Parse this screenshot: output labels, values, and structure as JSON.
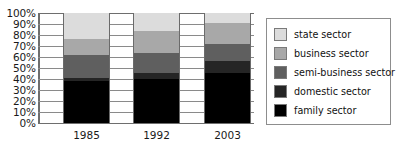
{
  "chart_data": {
    "type": "bar",
    "subtype": "stacked-100-percent",
    "title": "",
    "xlabel": "",
    "ylabel": "",
    "categories": [
      "1985",
      "1992",
      "2003"
    ],
    "ylim": [
      0,
      100
    ],
    "y_ticks": [
      "0%",
      "10%",
      "20%",
      "30%",
      "40%",
      "50%",
      "60%",
      "70%",
      "80%",
      "90%",
      "100%"
    ],
    "y_unit": "%",
    "grid": true,
    "legend_position": "right",
    "stack_order_bottom_to_top": [
      "family sector",
      "domestic sector",
      "semi-business sector",
      "business sector",
      "state sector"
    ],
    "series": [
      {
        "name": "family sector",
        "color": "#000000",
        "values": [
          38,
          40,
          45
        ]
      },
      {
        "name": "domestic sector",
        "color": "#252525",
        "values": [
          3,
          5,
          11
        ]
      },
      {
        "name": "semi-business sector",
        "color": "#5f5f5f",
        "values": [
          21,
          19,
          16
        ]
      },
      {
        "name": "business sector",
        "color": "#a8a8a8",
        "values": [
          14,
          20,
          19
        ]
      },
      {
        "name": "state sector",
        "color": "#dcdcdc",
        "values": [
          24,
          16,
          9
        ]
      }
    ],
    "cumulative_tops": {
      "1985": {
        "family sector": 38,
        "domestic sector": 41,
        "semi-business sector": 62,
        "business sector": 76,
        "state sector": 100
      },
      "1992": {
        "family sector": 40,
        "domestic sector": 45,
        "semi-business sector": 64,
        "business sector": 84,
        "state sector": 100
      },
      "2003": {
        "family sector": 45,
        "domestic sector": 56,
        "semi-business sector": 72,
        "business sector": 91,
        "state sector": 100
      }
    }
  },
  "legend": {
    "entries": [
      {
        "label": "state sector",
        "color": "#dcdcdc"
      },
      {
        "label": "business sector",
        "color": "#a8a8a8"
      },
      {
        "label": "semi-business sector",
        "color": "#5f5f5f"
      },
      {
        "label": "domestic sector",
        "color": "#252525"
      },
      {
        "label": "family sector",
        "color": "#000000"
      }
    ]
  }
}
